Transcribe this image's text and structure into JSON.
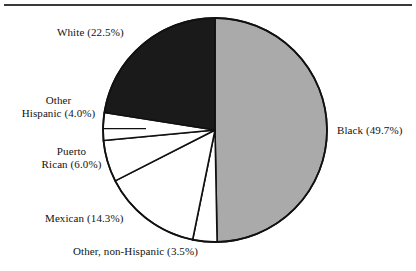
{
  "figure": {
    "background_color": "#ffffff",
    "rule_color": "#3a3a3a"
  },
  "chart_data": {
    "type": "pie",
    "title": "",
    "subtitle": "",
    "xlabel": "",
    "ylabel": "",
    "legend_position": "none",
    "grid": false,
    "start_angle_deg": 90,
    "direction": "clockwise",
    "units": "percent",
    "center": {
      "x": 215,
      "y": 130
    },
    "radius": 112,
    "categories": [
      "Black",
      "Other, non-Hispanic",
      "Mexican",
      "Puerto Rican",
      "Other Hispanic",
      "White"
    ],
    "values": [
      49.7,
      3.5,
      14.3,
      6.0,
      4.0,
      22.5
    ],
    "slices": [
      {
        "name": "Black",
        "value": 49.7,
        "value_text": "49.7%",
        "label": "Black (49.7%)",
        "label_lines": [
          "Black (49.7%)"
        ],
        "fill": "#aaaaaa",
        "stroke": "#111111"
      },
      {
        "name": "Other, non-Hispanic",
        "value": 3.5,
        "value_text": "3.5%",
        "label": "Other, non-Hispanic (3.5%)",
        "label_lines": [
          "Other, non-Hispanic (3.5%)"
        ],
        "fill": "#ffffff",
        "stroke": "#111111"
      },
      {
        "name": "Mexican",
        "value": 14.3,
        "value_text": "14.3%",
        "label": "Mexican (14.3%)",
        "label_lines": [
          "Mexican (14.3%)"
        ],
        "fill": "#ffffff",
        "stroke": "#111111"
      },
      {
        "name": "Puerto Rican",
        "value": 6.0,
        "value_text": "6.0%",
        "label": "Puerto Rican (6.0%)",
        "label_lines": [
          "Puerto",
          "Rican (6.0%)"
        ],
        "fill": "#ffffff",
        "stroke": "#111111"
      },
      {
        "name": "Other Hispanic",
        "value": 4.0,
        "value_text": "4.0%",
        "label": "Other Hispanic (4.0%)",
        "label_lines": [
          "Other",
          "Hispanic (4.0%)"
        ],
        "fill": "#ffffff",
        "stroke": "#111111"
      },
      {
        "name": "White",
        "value": 22.5,
        "value_text": "22.5%",
        "label": "White (22.5%)",
        "label_lines": [
          "White (22.5%)"
        ],
        "fill": "#1a1a1a",
        "stroke": "#111111"
      }
    ]
  },
  "labels": {
    "white": "White (22.5%)",
    "black": "Black (49.7%)",
    "other_hispanic_line1": "Other",
    "other_hispanic_line2": "Hispanic (4.0%)",
    "puerto_rican_line1": "Puerto",
    "puerto_rican_line2": "Rican (6.0%)",
    "mexican": "Mexican (14.3%)",
    "other_non_hispanic": "Other, non-Hispanic (3.5%)"
  }
}
